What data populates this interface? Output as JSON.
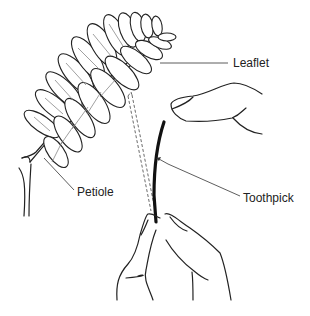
{
  "figure": {
    "type": "line-illustration",
    "labels": {
      "leaflet": "Leaflet",
      "petiole": "Petiole",
      "toothpick": "Toothpick"
    }
  }
}
